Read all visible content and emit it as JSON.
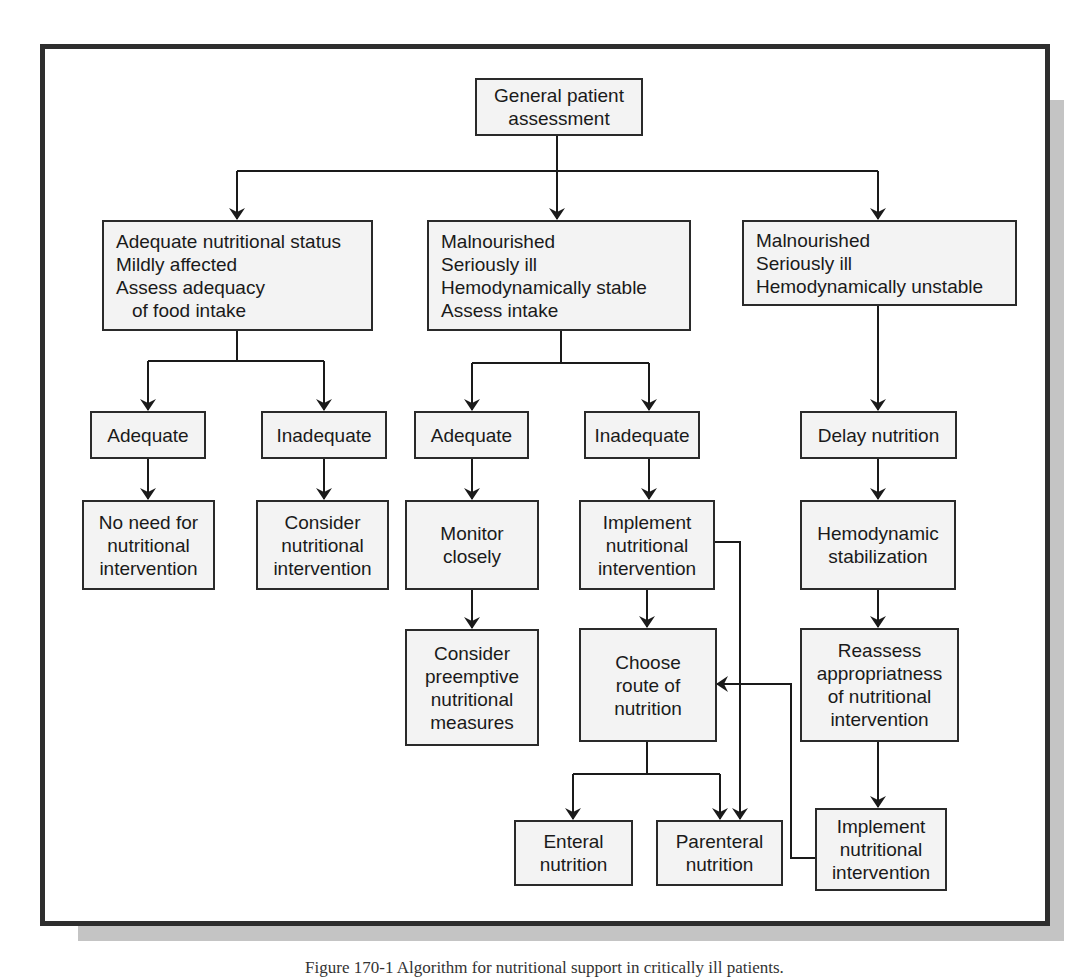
{
  "diagram": {
    "type": "flowchart",
    "root": {
      "id": "general",
      "lines": [
        "General patient",
        "assessment"
      ]
    },
    "branches": [
      {
        "id": "left",
        "lines": [
          "Adequate nutritional status",
          "Mildly affected",
          "Assess adequacy",
          "of food intake"
        ],
        "children": [
          {
            "id": "left-adequate",
            "lines": [
              "Adequate"
            ],
            "next": {
              "id": "no-need",
              "lines": [
                "No need for",
                "nutritional",
                "intervention"
              ]
            }
          },
          {
            "id": "left-inadequate",
            "lines": [
              "Inadequate"
            ],
            "next": {
              "id": "consider",
              "lines": [
                "Consider",
                "nutritional",
                "intervention"
              ]
            }
          }
        ]
      },
      {
        "id": "middle",
        "lines": [
          "Malnourished",
          "Seriously ill",
          "Hemodynamically stable",
          "Assess intake"
        ],
        "children": [
          {
            "id": "mid-adequate",
            "lines": [
              "Adequate"
            ],
            "next": {
              "id": "monitor",
              "lines": [
                "Monitor",
                "closely"
              ],
              "next": {
                "id": "preemptive",
                "lines": [
                  "Consider",
                  "preemptive",
                  "nutritional",
                  "measures"
                ]
              }
            }
          },
          {
            "id": "mid-inadequate",
            "lines": [
              "Inadequate"
            ],
            "next": {
              "id": "implement-mid",
              "lines": [
                "Implement",
                "nutritional",
                "intervention"
              ],
              "next": {
                "id": "choose-route",
                "lines": [
                  "Choose",
                  "route of",
                  "nutrition"
                ]
              }
            }
          }
        ]
      },
      {
        "id": "right",
        "lines": [
          "Malnourished",
          "Seriously ill",
          "Hemodynamically unstable"
        ],
        "children": [
          {
            "id": "delay",
            "lines": [
              "Delay nutrition"
            ]
          },
          {
            "id": "stabilization",
            "lines": [
              "Hemodynamic",
              "stabilization"
            ]
          },
          {
            "id": "reassess",
            "lines": [
              "Reassess",
              "appropriatness",
              "of nutritional",
              "intervention"
            ]
          },
          {
            "id": "implement-right",
            "lines": [
              "Implement",
              "nutritional",
              "intervention"
            ]
          }
        ]
      }
    ],
    "outcomes": [
      {
        "id": "enteral",
        "lines": [
          "Enteral",
          "nutrition"
        ]
      },
      {
        "id": "parenteral",
        "lines": [
          "Parenteral",
          "nutrition"
        ]
      }
    ],
    "edges": [
      [
        "general",
        "left"
      ],
      [
        "general",
        "middle"
      ],
      [
        "general",
        "right"
      ],
      [
        "left",
        "left-adequate"
      ],
      [
        "left",
        "left-inadequate"
      ],
      [
        "left-adequate",
        "no-need"
      ],
      [
        "left-inadequate",
        "consider"
      ],
      [
        "middle",
        "mid-adequate"
      ],
      [
        "middle",
        "mid-inadequate"
      ],
      [
        "mid-adequate",
        "monitor"
      ],
      [
        "monitor",
        "preemptive"
      ],
      [
        "mid-inadequate",
        "implement-mid"
      ],
      [
        "implement-mid",
        "choose-route"
      ],
      [
        "implement-mid",
        "parenteral"
      ],
      [
        "choose-route",
        "enteral"
      ],
      [
        "choose-route",
        "parenteral"
      ],
      [
        "right",
        "delay"
      ],
      [
        "delay",
        "stabilization"
      ],
      [
        "stabilization",
        "reassess"
      ],
      [
        "reassess",
        "implement-right"
      ],
      [
        "implement-right",
        "choose-route"
      ]
    ],
    "colors": {
      "box_fill": "#f3f3f3",
      "line": "#1a1a1a",
      "frame": "#2e2e2e",
      "shadow": "#c4c4c4"
    }
  },
  "caption": "Figure 170-1  Algorithm for nutritional support in critically ill patients."
}
